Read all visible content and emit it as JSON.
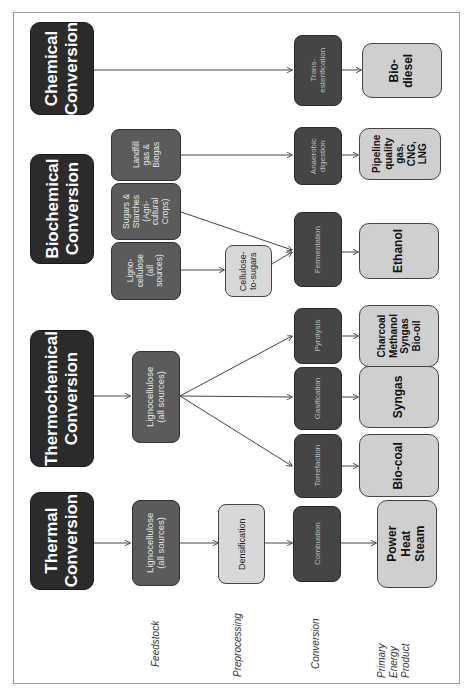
{
  "categories": {
    "chemical": "Chemical\nConversion",
    "biochemical": "Biochemical\nConversion",
    "thermochemical": "Thermochemical\nConversion",
    "thermal": "Thermal\nConversion"
  },
  "feedstock": {
    "landfill": "Landfill\ngas &\nBiogas",
    "sugars": "Sugars &\nStarches\n(Agri-\ncultural\nCrops)",
    "ligno_bio": "Ligno-\ncellulose\n(all\nsources)",
    "ligno_thermochem": "Lignocellulose\n(all sources)",
    "ligno_thermal": "Lignocellulose\n(all sources)"
  },
  "preprocessing": {
    "cellulose_to_sugars": "Cellulose-\nto-sugars",
    "densification": "Densification"
  },
  "conversion": {
    "transesterification": "Trans-\nesterification",
    "anaerobic": "Anaerobic\ndigestion",
    "fermentation": "Fermentation",
    "pyrolysis": "Pyrolysis",
    "gasification": "Gasification",
    "torrefaction": "Torrefaction",
    "combustion": "Combustion"
  },
  "products": {
    "biodiesel": "Bio-\ndiesel",
    "pipeline_gas": "Pipeline\nquality\ngas,\nCNG,\nLNG",
    "ethanol": "Ethanol",
    "pyrolysis_products": "Charcoal\nMethanol\nSyngas\nBio-oil",
    "syngas": "Syngas",
    "biocoal": "Bio-coal",
    "power": "Power\nHeat\nSteam"
  },
  "stage_labels": {
    "feedstock": "Feedstock",
    "preprocessing": "Preprocessing",
    "conversion": "Conversion",
    "product": "Primary\nEnergy\nProduct"
  },
  "colors": {
    "category_fill": "#2b2b2b",
    "feedstock_fill": "#5b5b5b",
    "preprocessing_fill": "#d8d8d8",
    "conversion_fill": "#454545",
    "product_fill": "#cfcfcf",
    "connector": "#444444"
  }
}
